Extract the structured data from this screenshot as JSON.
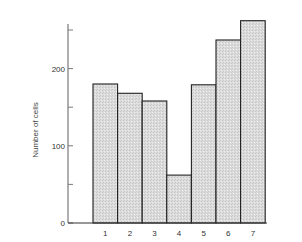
{
  "chart_data": {
    "type": "bar",
    "title": "",
    "xlabel": "",
    "ylabel": "Number of cells",
    "categories": [
      "1",
      "2",
      "3",
      "4",
      "5",
      "6",
      "7"
    ],
    "values": [
      180,
      168,
      158,
      62,
      179,
      237,
      262
    ],
    "ylim": [
      0,
      270
    ],
    "yticks": [
      0,
      50,
      100,
      150,
      200,
      250
    ],
    "ytick_labels": [
      "0",
      "",
      "100",
      "",
      "200",
      ""
    ],
    "grid": false,
    "legend": null,
    "bar_fill": "#d9d9d9",
    "bar_edge": "#222222",
    "axis_color": "#7a7a7a"
  }
}
